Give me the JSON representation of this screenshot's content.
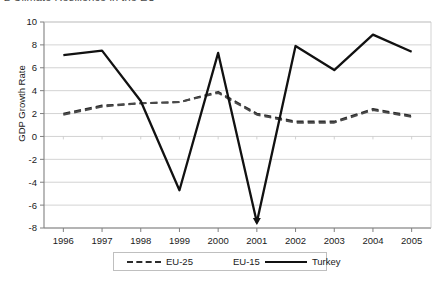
{
  "title_sliver": "2  Climate Resilience in the EU",
  "chart_data": {
    "type": "line",
    "title": "",
    "xlabel": "",
    "ylabel": "GDP Growth Rate",
    "categories": [
      "1996",
      "1997",
      "1998",
      "1999",
      "2000",
      "2001",
      "2002",
      "2003",
      "2004",
      "2005"
    ],
    "x": [
      1996,
      1997,
      1998,
      1999,
      2000,
      2001,
      2002,
      2003,
      2004,
      2005
    ],
    "ylim": [
      -8,
      10
    ],
    "ytick_step": 2,
    "yticks": [
      -8,
      -6,
      -4,
      -2,
      0,
      2,
      4,
      6,
      8,
      10
    ],
    "grid": true,
    "grid_axis": "y",
    "legend_position": "bottom",
    "series": [
      {
        "name": "EU-25",
        "style": "dashed",
        "color": "#2b2b2b",
        "values": [
          2.0,
          2.7,
          2.9,
          3.0,
          3.9,
          2.0,
          1.3,
          1.3,
          2.4,
          1.8
        ]
      },
      {
        "name": "EU-15",
        "style": "dashed",
        "color": "#4a4a4a",
        "values": [
          1.9,
          2.6,
          2.9,
          3.0,
          3.8,
          1.9,
          1.2,
          1.2,
          2.3,
          1.7
        ]
      },
      {
        "name": "Turkey",
        "style": "solid",
        "color": "#111111",
        "values": [
          7.1,
          7.5,
          3.1,
          -4.7,
          7.3,
          -7.5,
          7.9,
          5.8,
          8.9,
          7.4
        ]
      }
    ]
  },
  "legend": {
    "items": [
      {
        "label": "EU-25",
        "swatch": "dash"
      },
      {
        "label": "EU-15",
        "swatch": "hidden"
      },
      {
        "label": "Turkey",
        "swatch": "solid"
      }
    ]
  },
  "colors": {
    "axis": "#808080",
    "grid": "#c8c8c8",
    "turkey": "#111111",
    "eu25": "#2b2b2b",
    "eu15": "#4a4a4a"
  }
}
